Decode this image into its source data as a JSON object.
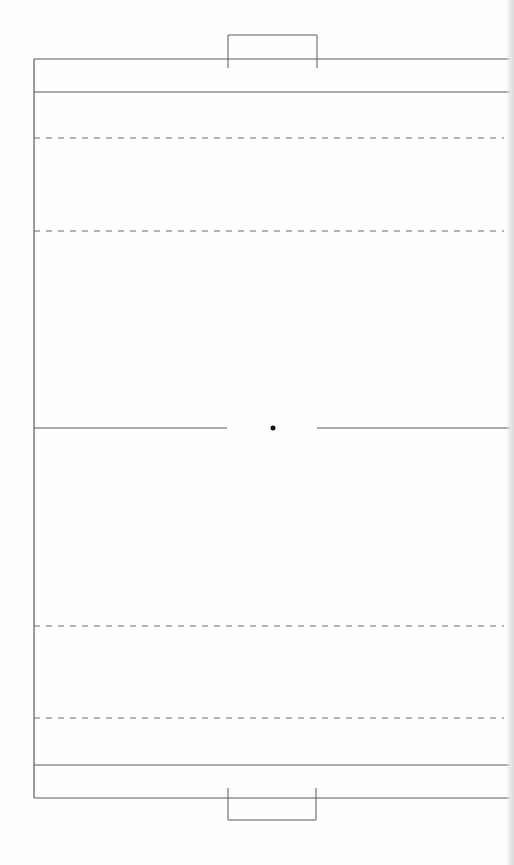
{
  "diagram": {
    "type": "sports-field-layout",
    "orientation": "vertical",
    "colors": {
      "background": "#fefefe",
      "line": "#5a5a5a",
      "dashed_line": "#6a6a6a",
      "center_spot": "#111111"
    },
    "field": {
      "left": 34,
      "top": 59,
      "right": 510,
      "bottom": 798
    },
    "end_lines": [
      {
        "name": "top-end-zone-line",
        "y": 92
      },
      {
        "name": "bottom-end-zone-line",
        "y": 765
      }
    ],
    "dashed_lines": [
      {
        "name": "top-dashed-line-1",
        "y": 138
      },
      {
        "name": "top-dashed-line-2",
        "y": 231
      },
      {
        "name": "bottom-dashed-line-1",
        "y": 626
      },
      {
        "name": "bottom-dashed-line-2",
        "y": 718
      }
    ],
    "center_line": {
      "y": 428,
      "gap_start": 227,
      "gap_end": 317
    },
    "center_spot": {
      "x": 273,
      "y": 428,
      "r": 2.5
    },
    "goals": [
      {
        "name": "top-goal",
        "x1": 228,
        "x2": 317,
        "y_outer": 35,
        "y_inner": 68
      },
      {
        "name": "bottom-goal",
        "x1": 228,
        "x2": 316,
        "y_outer": 820,
        "y_inner": 788
      }
    ]
  }
}
